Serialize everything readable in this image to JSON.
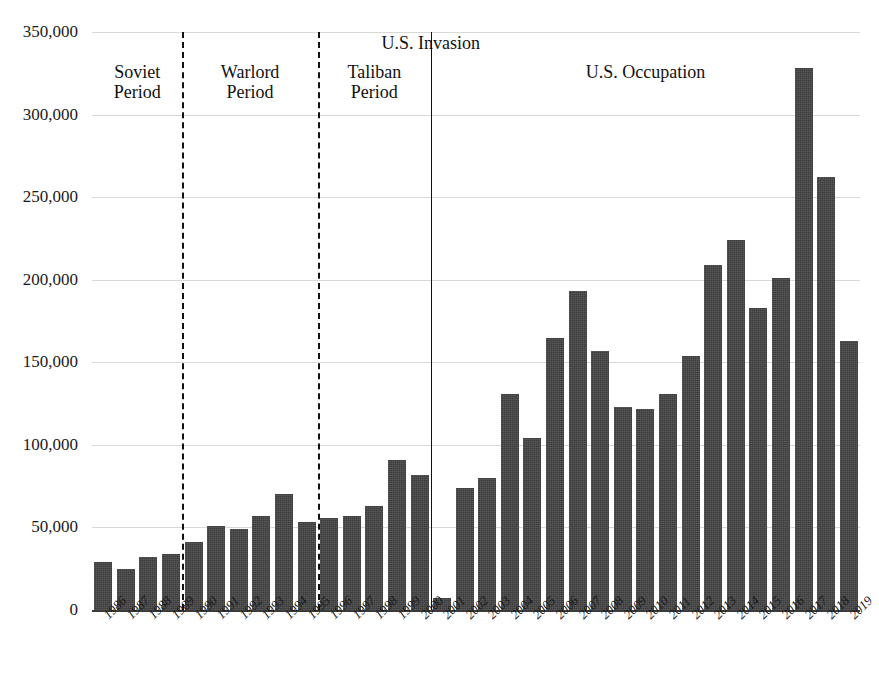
{
  "chart_data": {
    "type": "bar",
    "title": "",
    "subtitle": "",
    "xlabel": "",
    "ylabel": "",
    "grid": true,
    "legend_position": "none",
    "ylim": [
      0,
      350000
    ],
    "ytick_labels": [
      "350,000",
      "300,000",
      "250,000",
      "200,000",
      "150,000",
      "100,000",
      "50,000",
      "0"
    ],
    "ytick_values": [
      350000,
      300000,
      250000,
      200000,
      150000,
      100000,
      50000,
      0
    ],
    "bar_color": "#3d3d3d",
    "categories": [
      "1986",
      "1987",
      "1988",
      "1989",
      "1990",
      "1991",
      "1992",
      "1993",
      "1994",
      "1995",
      "1996",
      "1997",
      "1998",
      "1999",
      "2000",
      "2001",
      "2002",
      "2003",
      "2004",
      "2005",
      "2006",
      "2007",
      "2008",
      "2009",
      "2010",
      "2011",
      "2012",
      "2013",
      "2014",
      "2015",
      "2016",
      "2017",
      "2018",
      "2019"
    ],
    "values": [
      29000,
      25000,
      32000,
      34000,
      41000,
      51000,
      49000,
      57000,
      70000,
      53000,
      56000,
      57000,
      63000,
      91000,
      82000,
      7000,
      74000,
      80000,
      131000,
      104000,
      165000,
      193000,
      157000,
      123000,
      122000,
      131000,
      154000,
      209000,
      224000,
      183000,
      201000,
      328000,
      262000,
      163000
    ],
    "annotations": [
      {
        "name": "soviet-period",
        "label": "Soviet\nPeriod",
        "kind": "period",
        "start_year": "1986",
        "end_year": "1989"
      },
      {
        "name": "warlord-period",
        "label": "Warlord\nPeriod",
        "kind": "period",
        "start_year": "1990",
        "end_year": "1995"
      },
      {
        "name": "taliban-period",
        "label": "Taliban\nPeriod",
        "kind": "period",
        "start_year": "1996",
        "end_year": "2000"
      },
      {
        "name": "us-invasion",
        "label": "U.S. Invasion",
        "kind": "event",
        "year": "2001"
      },
      {
        "name": "us-occupation",
        "label": "U.S. Occupation",
        "kind": "period",
        "start_year": "2001",
        "end_year": "2019"
      }
    ],
    "dividers": [
      {
        "name": "soviet-warlord-divider",
        "style": "dashed",
        "after_year": "1989"
      },
      {
        "name": "warlord-taliban-divider",
        "style": "dashed",
        "after_year": "1995"
      },
      {
        "name": "us-invasion-divider",
        "style": "solid",
        "after_year": "2000"
      }
    ]
  }
}
